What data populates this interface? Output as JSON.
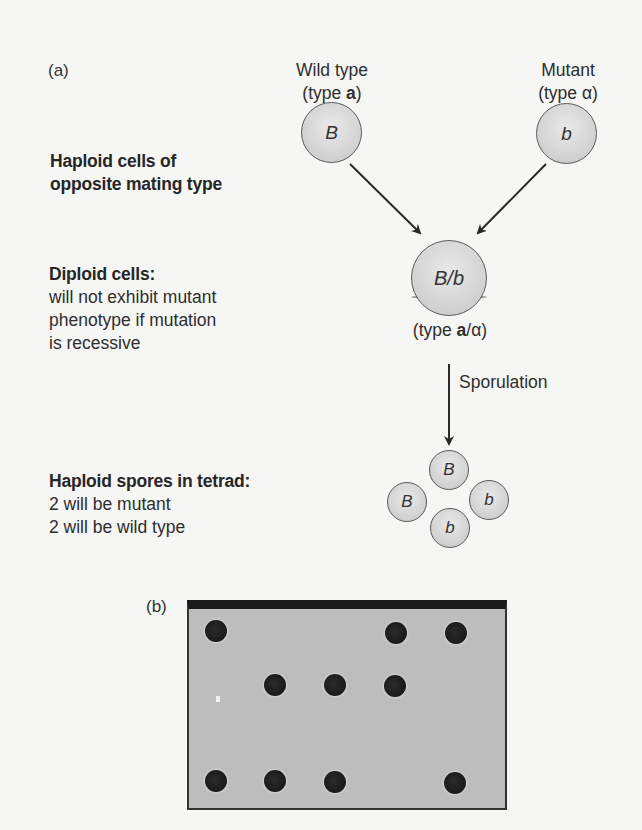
{
  "panel_a": {
    "label": "(a)",
    "wild_type": {
      "line1": "Wild type",
      "line2_prefix": "(type ",
      "line2_bold": "a",
      "line2_suffix": ")",
      "allele": "B"
    },
    "mutant": {
      "line1": "Mutant",
      "line2": "(type α)",
      "allele": "b"
    },
    "haploid_label": {
      "line1": "Haploid cells of",
      "line2": "opposite mating type"
    },
    "diploid_label": {
      "title": "Diploid cells:",
      "lines": [
        "will not exhibit mutant",
        "phenotype if mutation",
        "is recessive"
      ]
    },
    "diploid_cell": {
      "allele": "B/b",
      "type_prefix": "(type ",
      "type_bold": "a",
      "type_suffix": "/α)"
    },
    "sporulation_label": "Sporulation",
    "tetrad_label": {
      "title": "Haploid spores in tetrad:",
      "lines": [
        "2 will be mutant",
        "2 will be wild type"
      ]
    },
    "tetrad_spores": [
      {
        "allele": "B",
        "position": "top"
      },
      {
        "allele": "B",
        "position": "left"
      },
      {
        "allele": "b",
        "position": "right"
      },
      {
        "allele": "b",
        "position": "bottom"
      }
    ]
  },
  "panel_b": {
    "label": "(b)",
    "plate_background": "#bdbdbd",
    "colony_color": "#1e1e1e",
    "colonies_grid": {
      "columns": 5,
      "rows": 3,
      "present": [
        [
          1,
          0,
          0,
          1,
          1
        ],
        [
          0,
          1,
          1,
          1,
          0
        ],
        [
          1,
          1,
          1,
          0,
          1
        ]
      ]
    }
  }
}
